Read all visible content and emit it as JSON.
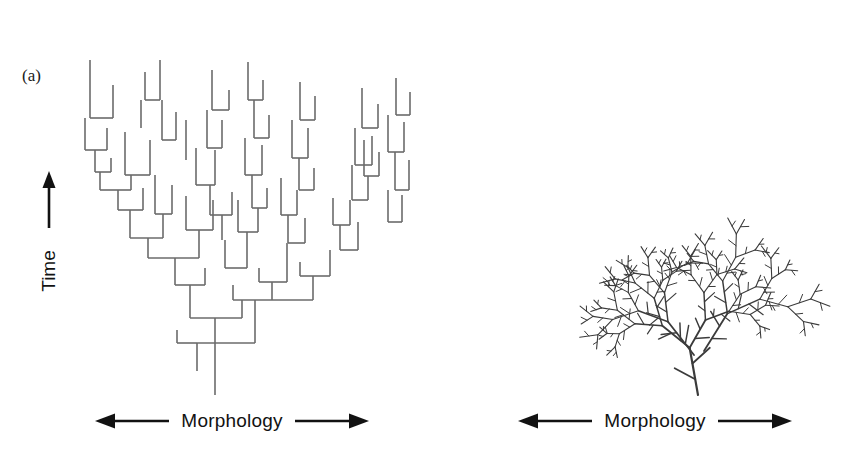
{
  "figure": {
    "type": "scientific-figure",
    "background_color": "#ffffff",
    "panels": [
      {
        "id": "a",
        "label": "(a)",
        "style": "rectilinear-cladogram",
        "line_color": "#6b6b6b",
        "line_width": 1.6,
        "axes": {
          "y": {
            "label": "Time",
            "arrow": "up",
            "arrow_icon": "arrow-up-icon"
          },
          "x": {
            "label": "Morphology",
            "left_arrow_icon": "arrow-left-icon",
            "right_arrow_icon": "arrow-right-icon"
          }
        }
      },
      {
        "id": "b",
        "label": "(b)",
        "style": "organic-fractal-branching",
        "line_color": "#3b3b3b",
        "line_width": 1.9,
        "axes": {
          "x": {
            "label": "Morphology",
            "left_arrow_icon": "arrow-left-icon",
            "right_arrow_icon": "arrow-right-icon"
          }
        }
      }
    ]
  },
  "chart_data": {
    "type": "diagram",
    "title": "",
    "panel_a": {
      "render": "orthogonal",
      "root": {
        "x": 215,
        "y": 395
      },
      "segments_note": "Rectilinear tree: vertical stems with horizontal connectors, drawn bottom-up; time increases upward.",
      "vertical_segments": [
        [
          215,
          395,
          215,
          343
        ],
        [
          197,
          371,
          197,
          343
        ],
        [
          177,
          343,
          177,
          330
        ],
        [
          255,
          343,
          255,
          300
        ],
        [
          215,
          343,
          215,
          318
        ],
        [
          190,
          318,
          190,
          285
        ],
        [
          242,
          318,
          242,
          300
        ],
        [
          233,
          300,
          233,
          285
        ],
        [
          272,
          300,
          272,
          282
        ],
        [
          259,
          282,
          259,
          268
        ],
        [
          287,
          282,
          287,
          243
        ],
        [
          313,
          300,
          313,
          276
        ],
        [
          300,
          276,
          300,
          262
        ],
        [
          330,
          276,
          330,
          250
        ],
        [
          175,
          285,
          175,
          258
        ],
        [
          205,
          285,
          205,
          268
        ],
        [
          148,
          258,
          148,
          238
        ],
        [
          199,
          258,
          199,
          230
        ],
        [
          130,
          238,
          130,
          210
        ],
        [
          163,
          238,
          163,
          214
        ],
        [
          118,
          210,
          118,
          190
        ],
        [
          143,
          210,
          143,
          188
        ],
        [
          100,
          190,
          100,
          172
        ],
        [
          131,
          190,
          131,
          175
        ],
        [
          95,
          172,
          95,
          150
        ],
        [
          111,
          172,
          111,
          158
        ],
        [
          85,
          150,
          85,
          118
        ],
        [
          107,
          150,
          107,
          128
        ],
        [
          155,
          214,
          155,
          175
        ],
        [
          172,
          214,
          172,
          185
        ],
        [
          186,
          230,
          186,
          196
        ],
        [
          213,
          230,
          213,
          200
        ],
        [
          225,
          268,
          225,
          240
        ],
        [
          247,
          268,
          247,
          232
        ],
        [
          238,
          232,
          238,
          200
        ],
        [
          258,
          232,
          258,
          208
        ],
        [
          252,
          208,
          252,
          175
        ],
        [
          267,
          208,
          267,
          188
        ],
        [
          222,
          240,
          222,
          215
        ],
        [
          210,
          215,
          210,
          185
        ],
        [
          232,
          215,
          232,
          192
        ],
        [
          288,
          243,
          288,
          215
        ],
        [
          305,
          243,
          305,
          218
        ],
        [
          281,
          215,
          281,
          178
        ],
        [
          297,
          215,
          297,
          190
        ],
        [
          299,
          190,
          299,
          158
        ],
        [
          314,
          190,
          314,
          168
        ],
        [
          340,
          250,
          340,
          225
        ],
        [
          358,
          250,
          358,
          222
        ],
        [
          333,
          225,
          333,
          198
        ],
        [
          350,
          225,
          350,
          200
        ],
        [
          352,
          200,
          352,
          165
        ],
        [
          368,
          200,
          368,
          176
        ],
        [
          364,
          176,
          364,
          140
        ],
        [
          379,
          176,
          379,
          152
        ],
        [
          388,
          222,
          388,
          190
        ],
        [
          402,
          222,
          402,
          195
        ],
        [
          395,
          190,
          395,
          152
        ],
        [
          409,
          190,
          409,
          160
        ],
        [
          141,
          128,
          141,
          100
        ],
        [
          113,
          118,
          113,
          85
        ],
        [
          90,
          118,
          90,
          60
        ],
        [
          125,
          175,
          125,
          132
        ],
        [
          150,
          175,
          150,
          140
        ],
        [
          162,
          140,
          162,
          100
        ],
        [
          176,
          140,
          176,
          112
        ],
        [
          145,
          100,
          145,
          72
        ],
        [
          160,
          100,
          160,
          60
        ],
        [
          196,
          185,
          196,
          148
        ],
        [
          215,
          185,
          215,
          150
        ],
        [
          207,
          148,
          207,
          110
        ],
        [
          222,
          148,
          222,
          120
        ],
        [
          212,
          110,
          212,
          70
        ],
        [
          229,
          110,
          229,
          90
        ],
        [
          186,
          160,
          186,
          120
        ],
        [
          245,
          175,
          245,
          138
        ],
        [
          262,
          175,
          262,
          145
        ],
        [
          254,
          138,
          254,
          100
        ],
        [
          269,
          138,
          269,
          115
        ],
        [
          248,
          100,
          248,
          62
        ],
        [
          263,
          100,
          263,
          80
        ],
        [
          292,
          158,
          292,
          120
        ],
        [
          308,
          158,
          308,
          128
        ],
        [
          300,
          120,
          300,
          82
        ],
        [
          315,
          120,
          315,
          96
        ],
        [
          355,
          165,
          355,
          128
        ],
        [
          372,
          165,
          372,
          136
        ],
        [
          362,
          128,
          362,
          88
        ],
        [
          378,
          128,
          378,
          104
        ],
        [
          388,
          152,
          388,
          115
        ],
        [
          404,
          152,
          404,
          122
        ],
        [
          396,
          115,
          396,
          78
        ],
        [
          410,
          115,
          410,
          92
        ]
      ],
      "horizontal_segments": [
        [
          197,
          343,
          255,
          343
        ],
        [
          177,
          343,
          197,
          343
        ],
        [
          190,
          318,
          242,
          318
        ],
        [
          233,
          300,
          313,
          300
        ],
        [
          259,
          282,
          287,
          282
        ],
        [
          300,
          276,
          330,
          276
        ],
        [
          175,
          285,
          205,
          285
        ],
        [
          148,
          258,
          199,
          258
        ],
        [
          130,
          238,
          163,
          238
        ],
        [
          118,
          210,
          143,
          210
        ],
        [
          100,
          190,
          131,
          190
        ],
        [
          95,
          172,
          111,
          172
        ],
        [
          85,
          150,
          107,
          150
        ],
        [
          155,
          214,
          172,
          214
        ],
        [
          186,
          230,
          213,
          230
        ],
        [
          225,
          268,
          247,
          268
        ],
        [
          238,
          232,
          258,
          232
        ],
        [
          252,
          208,
          267,
          208
        ],
        [
          210,
          215,
          232,
          215
        ],
        [
          288,
          243,
          305,
          243
        ],
        [
          281,
          215,
          297,
          215
        ],
        [
          299,
          190,
          314,
          190
        ],
        [
          340,
          250,
          358,
          250
        ],
        [
          333,
          225,
          350,
          225
        ],
        [
          352,
          200,
          368,
          200
        ],
        [
          364,
          176,
          379,
          176
        ],
        [
          388,
          222,
          402,
          222
        ],
        [
          395,
          190,
          409,
          190
        ],
        [
          90,
          118,
          113,
          118
        ],
        [
          125,
          175,
          150,
          175
        ],
        [
          162,
          140,
          176,
          140
        ],
        [
          145,
          100,
          160,
          100
        ],
        [
          196,
          185,
          215,
          185
        ],
        [
          207,
          148,
          222,
          148
        ],
        [
          212,
          110,
          229,
          110
        ],
        [
          245,
          175,
          262,
          175
        ],
        [
          254,
          138,
          269,
          138
        ],
        [
          248,
          100,
          263,
          100
        ],
        [
          292,
          158,
          308,
          158
        ],
        [
          300,
          120,
          315,
          120
        ],
        [
          355,
          165,
          372,
          165
        ],
        [
          362,
          128,
          378,
          128
        ],
        [
          388,
          152,
          404,
          152
        ],
        [
          396,
          115,
          410,
          115
        ]
      ]
    },
    "panel_b": {
      "render": "fractal",
      "root": {
        "x": 268,
        "y": 395
      },
      "trunk_angle_deg": -100,
      "trunk_length": 48,
      "depth": 6,
      "branch_angle_deg": 34,
      "length_ratio": 0.76,
      "side_twig_ratio": 0.42,
      "seed": 7
    }
  },
  "text": {
    "time_label": "Time",
    "morphology_label": "Morphology",
    "label_a": "(a)",
    "label_b": "(b)"
  }
}
